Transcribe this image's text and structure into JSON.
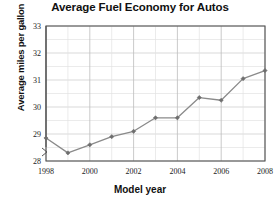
{
  "chart_data": {
    "type": "line",
    "title": "Average Fuel Economy for Autos",
    "xlabel": "Model year",
    "ylabel": "Average miles per gallon",
    "x": [
      1998,
      1999,
      2000,
      2001,
      2002,
      2003,
      2004,
      2005,
      2006,
      2007,
      2008
    ],
    "values": [
      28.85,
      28.3,
      28.6,
      28.9,
      29.1,
      29.6,
      29.6,
      30.35,
      30.25,
      31.05,
      31.35
    ],
    "series": [
      {
        "name": "Average miles per gallon",
        "values": [
          28.85,
          28.3,
          28.6,
          28.9,
          29.1,
          29.6,
          29.6,
          30.35,
          30.25,
          31.05,
          31.35
        ]
      }
    ],
    "xlim": [
      1998,
      2008
    ],
    "ylim": [
      28,
      33
    ],
    "y_tick_labels": [
      "28",
      "29",
      "30",
      "31",
      "32",
      "33"
    ],
    "y_ticks": [
      28,
      29,
      30,
      31,
      32,
      33
    ],
    "x_tick_labels": [
      "1998",
      "2000",
      "2002",
      "2004",
      "2006",
      "2008"
    ],
    "x_ticks": [
      1998,
      2000,
      2002,
      2004,
      2006,
      2008
    ],
    "grid": true,
    "minor_grid_step": 0.5,
    "legend": null,
    "axis_break": true,
    "axis_break_note": "y-axis broken below 28",
    "line_color": "#8a8a8a",
    "marker_color": "#6e6e6e",
    "marker": "diamond",
    "grid_color": "#cfcfcf",
    "axis_color": "#555555",
    "background": "#ffffff"
  }
}
